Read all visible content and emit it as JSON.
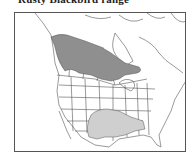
{
  "title": "Rusty Blackbird range",
  "map": {
    "region": "North America",
    "legend_colors": {
      "breeding_range": "#8f8f8f",
      "winter_range": "#cfcfcf",
      "background": "#ffffff",
      "boundaries": "#555555"
    }
  }
}
